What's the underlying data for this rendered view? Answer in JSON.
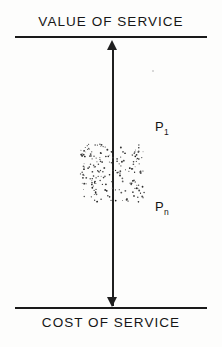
{
  "figure": {
    "top_boundary_label": "VALUE OF SERVICE",
    "bottom_boundary_label": "COST OF SERVICE",
    "upper_price_label": "P",
    "upper_price_subscript": "1",
    "lower_price_label": "P",
    "lower_price_subscript": "n",
    "ink_color": "#1a1a1a",
    "background_color": "#fdfdfc"
  },
  "chart_data": {
    "type": "diagram",
    "title": "",
    "orientation": "vertical",
    "axis": {
      "label": "price",
      "style": "double-headed-arrow",
      "top_anchor": "VALUE OF SERVICE",
      "bottom_anchor": "COST OF SERVICE",
      "top_y_px": 36,
      "bottom_y_px": 307,
      "x_px": 112
    },
    "boundaries": [
      {
        "name": "ceiling",
        "label": "VALUE OF SERVICE",
        "position": "top"
      },
      {
        "name": "floor",
        "label": "COST OF SERVICE",
        "position": "bottom"
      }
    ],
    "regions": [
      {
        "name": "feasible-price-range",
        "fill": "stipple",
        "x_px": 79,
        "y_px": 143,
        "width_px": 67,
        "height_px": 60,
        "dot_count": 196,
        "upper_bound_label": "P1",
        "lower_bound_label": "Pn"
      }
    ],
    "annotations": [
      {
        "text": "P1",
        "x_px": 155,
        "y_px": 125,
        "meaning": "highest price in range"
      },
      {
        "text": "Pn",
        "x_px": 155,
        "y_px": 205,
        "meaning": "lowest price in range"
      }
    ],
    "grid": false,
    "legend": null
  }
}
